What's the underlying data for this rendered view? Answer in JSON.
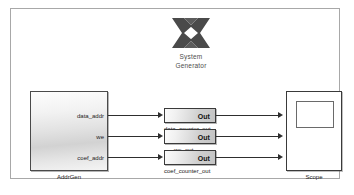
{
  "diagram": {
    "background_color": "#ffffff",
    "frame_border_color": "#a8a8a8"
  },
  "sysgen": {
    "logo_name": "xilinx-logo",
    "line1": "System",
    "line2": "Generator",
    "logo_color": "#4a4a4a"
  },
  "addrgen": {
    "caption": "AddrGen",
    "ports": [
      {
        "label": "data_addr"
      },
      {
        "label": "we"
      },
      {
        "label": "coef_addr"
      }
    ]
  },
  "gateways": [
    {
      "label": "Out",
      "caption": "data_counter_out"
    },
    {
      "label": "Out",
      "caption": "we_out"
    },
    {
      "label": "Out",
      "caption": "coef_counter_out"
    }
  ],
  "scope": {
    "caption": "Scope",
    "inputs": 3
  },
  "wire_color": "#2e2e2e"
}
